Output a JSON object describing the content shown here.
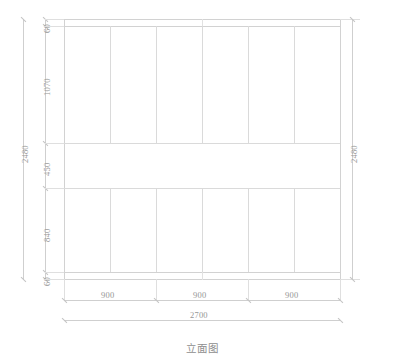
{
  "drawing": {
    "title": "立面图",
    "view_type": "elevation",
    "units": "mm",
    "overall_width": 2700,
    "overall_height": 2480
  },
  "dimensions": {
    "left_chain": {
      "label": "vertical-dimension-chain",
      "segments": [
        {
          "value": "60",
          "meaning": "top-rail"
        },
        {
          "value": "1070",
          "meaning": "upper-panel-section"
        },
        {
          "value": "450",
          "meaning": "open-middle-band"
        },
        {
          "value": "840",
          "meaning": "lower-panel-section"
        },
        {
          "value": "60",
          "meaning": "bottom-rail"
        }
      ],
      "total": "2480"
    },
    "right_chain": {
      "label": "overall-height",
      "total": "2480"
    },
    "bottom_chain": {
      "label": "horizontal-dimension-chain",
      "segments": [
        {
          "value": "900",
          "meaning": "bay-1"
        },
        {
          "value": "900",
          "meaning": "bay-2"
        },
        {
          "value": "900",
          "meaning": "bay-3"
        }
      ],
      "total": "2700"
    }
  },
  "geometry": {
    "upper_section": {
      "name": "upper-panel-section",
      "panel_count": 6,
      "height": "1070"
    },
    "middle_section": {
      "name": "open-middle-band",
      "panel_count": 0,
      "height": "450"
    },
    "lower_section": {
      "name": "lower-panel-section",
      "panel_count": 6,
      "height": "840"
    }
  },
  "colors": {
    "line": "#dcdcdc",
    "frame": "#d2d2d2",
    "dimension": "#cfcfcf",
    "text": "#969696",
    "background": "#ffffff"
  }
}
